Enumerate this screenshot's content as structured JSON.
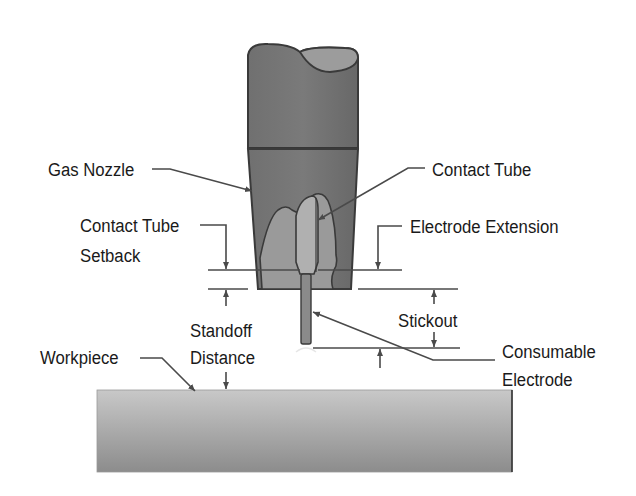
{
  "diagram": {
    "type": "GMAW welding torch cross-section",
    "colors": {
      "nozzle": "#6e6e6e",
      "nozzle_outline": "#3a3a3a",
      "cable_top": "#9a9a9a",
      "contact_tube": "#a8a8a8",
      "electrode": "#8a8a8a",
      "workpiece_light": "#c4c4c4",
      "workpiece_dark": "#8f8f8f",
      "leader": "#4a4a4a",
      "text": "#1a1a1a"
    },
    "labels": {
      "gas_nozzle": "Gas Nozzle",
      "contact_tube": "Contact Tube",
      "contact_tube_setback_1": "Contact Tube",
      "contact_tube_setback_2": "Setback",
      "electrode_extension": "Electrode Extension",
      "stickout": "Stickout",
      "standoff_1": "Standoff",
      "standoff_2": "Distance",
      "workpiece": "Workpiece",
      "consumable_1": "Consumable",
      "consumable_2": "Electrode"
    }
  }
}
